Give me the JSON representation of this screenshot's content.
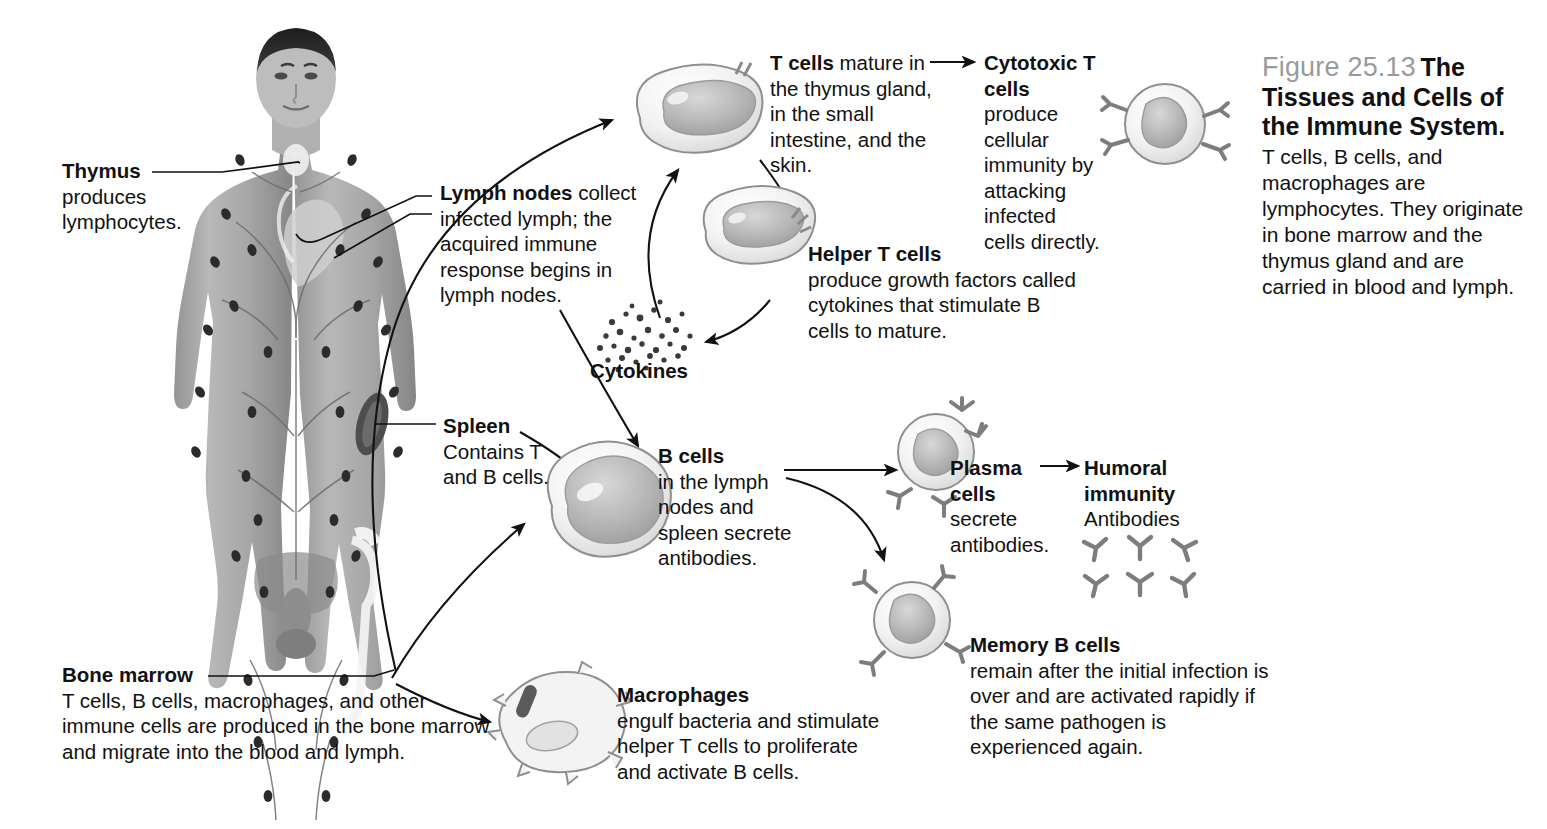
{
  "figure": {
    "number": "Figure 25.13",
    "title": "The Tissues and Cells of the Immune System.",
    "body": "T cells, B cells, and macrophages are lymphocytes. They originate in bone marrow and the thymus gland and are carried in blood and lymph."
  },
  "organs": {
    "thymus": {
      "term": "Thymus",
      "text": "produces lymphocytes."
    },
    "lymph_nodes": {
      "term": "Lymph nodes",
      "text": "collect infected lymph; the acquired immune response begins in lymph nodes."
    },
    "spleen": {
      "term": "Spleen",
      "text": "Contains T and B cells."
    },
    "bone_marrow": {
      "term": "Bone marrow",
      "text": "T cells, B cells, macrophages, and other immune cells are produced in the bone marrow and migrate into the blood and lymph."
    }
  },
  "cells": {
    "t_cells": {
      "term": "T cells",
      "text": "mature in",
      "text2": "the thymus gland, in the small intestine, and the skin."
    },
    "cytotoxic_t": {
      "term": "Cytotoxic T cells",
      "text": "produce cellular immunity by attacking infected cells directly."
    },
    "helper_t": {
      "term": "Helper T cells",
      "text": "produce growth factors called cytokines that stimulate B cells to mature."
    },
    "cytokines": {
      "term": "Cytokines"
    },
    "b_cells": {
      "term": "B cells",
      "text": "in the lymph nodes and spleen secrete antibodies."
    },
    "plasma_cells": {
      "term": "Plasma cells",
      "text": "secrete antibodies."
    },
    "humoral": {
      "term": "Humoral immunity",
      "text": "Antibodies"
    },
    "memory_b": {
      "term": "Memory B cells",
      "text": "remain after the initial infection is over and are activated rapidly if the same pathogen is experienced again."
    },
    "macrophages": {
      "term": "Macrophages",
      "text": "engulf bacteria and stimulate helper T cells to proliferate and activate B cells."
    }
  },
  "colors": {
    "ink": "#111111",
    "caption_gray": "#9a9a9a",
    "cell_outline": "#8b8b8b",
    "cell_fill": "#efefef",
    "nucleus": "#b9b9b9",
    "body_gray": "#a8a8a8",
    "receptor": "#7d7d7d",
    "bacterium": "#5a5a5a"
  }
}
